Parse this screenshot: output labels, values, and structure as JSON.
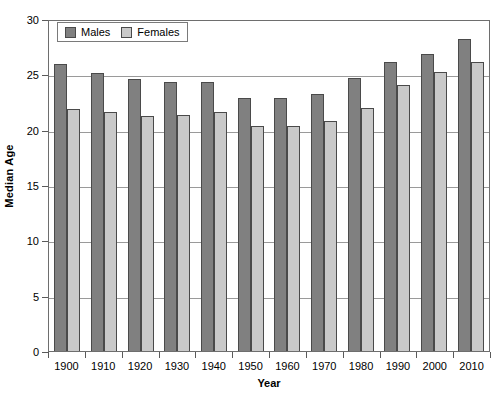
{
  "chart_data": {
    "type": "bar",
    "title": "",
    "xlabel": "Year",
    "ylabel": "Median Age",
    "categories": [
      "1900",
      "1910",
      "1920",
      "1930",
      "1940",
      "1950",
      "1960",
      "1970",
      "1980",
      "1990",
      "2000",
      "2010"
    ],
    "series": [
      {
        "name": "Males",
        "color": "#808080",
        "values": [
          25.9,
          25.1,
          24.6,
          24.3,
          24.3,
          22.9,
          22.9,
          23.2,
          24.7,
          26.1,
          26.8,
          28.2
        ]
      },
      {
        "name": "Females",
        "color": "#c9c9c9",
        "values": [
          21.9,
          21.6,
          21.2,
          21.3,
          21.6,
          20.3,
          20.3,
          20.8,
          22.0,
          24.0,
          25.2,
          26.1
        ]
      }
    ],
    "ylim": [
      0,
      30
    ],
    "yticks": [
      "0",
      "5",
      "10",
      "15",
      "20",
      "25",
      "30"
    ],
    "ytick_values": [
      0,
      5,
      10,
      15,
      20,
      25,
      30
    ],
    "grid": "horizontal",
    "legend_position": "top-left-inside",
    "axis_color": "#6e6e6e",
    "gridline_color": "#9a9a9a"
  },
  "legend": {
    "items": [
      {
        "label": "Males"
      },
      {
        "label": "Females"
      }
    ]
  }
}
